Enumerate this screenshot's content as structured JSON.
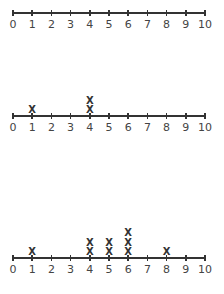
{
  "chart_data": [
    {
      "type": "dot_plot",
      "title": "",
      "xlabel": "",
      "ylabel": "",
      "axis_range": [
        0,
        10
      ],
      "tick_labels": [
        "0",
        "1",
        "2",
        "3",
        "4",
        "5",
        "6",
        "7",
        "8",
        "9",
        "10"
      ],
      "marker": "X",
      "counts": {}
    },
    {
      "type": "dot_plot",
      "title": "",
      "xlabel": "",
      "ylabel": "",
      "axis_range": [
        0,
        10
      ],
      "tick_labels": [
        "0",
        "1",
        "2",
        "3",
        "4",
        "5",
        "6",
        "7",
        "8",
        "9",
        "10"
      ],
      "marker": "X",
      "counts": {
        "1": 1,
        "4": 2
      }
    },
    {
      "type": "dot_plot",
      "title": "",
      "xlabel": "",
      "ylabel": "",
      "axis_range": [
        0,
        10
      ],
      "tick_labels": [
        "0",
        "1",
        "2",
        "3",
        "4",
        "5",
        "6",
        "7",
        "8",
        "9",
        "10"
      ],
      "marker": "X",
      "counts": {
        "1": 1,
        "4": 2,
        "5": 2,
        "6": 3,
        "8": 1
      }
    }
  ],
  "layout": {
    "axis_y": [
      12,
      115,
      257
    ],
    "x0": 13,
    "x10": 205,
    "mark_gap": 9.5
  }
}
